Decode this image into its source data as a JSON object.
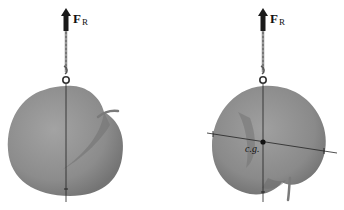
{
  "figure": {
    "panels": [
      {
        "id": "left",
        "force_label": "F",
        "force_subscript": "R",
        "description": "Apple suspended by a cord; vertical line of action through suspension point"
      },
      {
        "id": "right",
        "force_label": "F",
        "force_subscript": "R",
        "cg_label": "c.g.",
        "description": "Apple suspended from a second point; intersecting lines locate center of gravity"
      }
    ],
    "colors": {
      "apple": "#8f8f8f",
      "apple_shade": "#6f6f6f",
      "line": "#222222",
      "arrow": "#1a1a1a"
    }
  }
}
